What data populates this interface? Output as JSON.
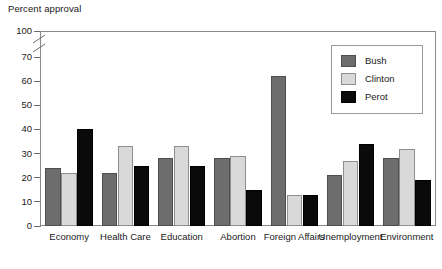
{
  "chart_data": {
    "type": "bar",
    "title": "",
    "ylabel": "Percent approval",
    "xlabel": "",
    "ylim": [
      0,
      100
    ],
    "yticks": [
      0,
      10,
      20,
      30,
      40,
      50,
      60,
      70,
      100
    ],
    "ytick_labels": [
      "0",
      "10",
      "20",
      "30",
      "40",
      "50",
      "60",
      "70",
      "100"
    ],
    "axis_break": {
      "between": [
        70,
        100
      ],
      "style": "zigzag"
    },
    "grid": false,
    "legend_position": "top-right",
    "categories": [
      "Economy",
      "Health Care",
      "Education",
      "Abortion",
      "Foreign Affairs",
      "Unemployment",
      "Environment"
    ],
    "series": [
      {
        "name": "Bush",
        "color": "#6d6d6d",
        "values": [
          24,
          22,
          28,
          28,
          62,
          21,
          28
        ]
      },
      {
        "name": "Clinton",
        "color": "#d9d9d9",
        "values": [
          22,
          33,
          33,
          29,
          13,
          27,
          32
        ]
      },
      {
        "name": "Perot",
        "color": "#0a0a0a",
        "values": [
          40,
          25,
          25,
          15,
          13,
          34,
          19
        ]
      }
    ]
  },
  "axis": {
    "y_title": "Percent approval"
  },
  "legend": {
    "entries": [
      {
        "label": "Bush",
        "key": "bush"
      },
      {
        "label": "Clinton",
        "key": "clinton"
      },
      {
        "label": "Perot",
        "key": "perot"
      }
    ]
  }
}
